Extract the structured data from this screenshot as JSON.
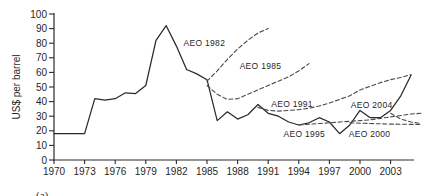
{
  "figure": {
    "caption": "(a)"
  },
  "chart_data": {
    "type": "line",
    "title": "",
    "xlabel": "",
    "ylabel": "US$ per barrel",
    "ylim": [
      0,
      100
    ],
    "xlim": [
      1970,
      2006.5
    ],
    "grid": false,
    "legend_position": "none",
    "y_ticks": [
      0,
      10,
      20,
      30,
      40,
      50,
      60,
      70,
      80,
      90,
      100
    ],
    "x_ticks": [
      1970,
      1973,
      1976,
      1979,
      1982,
      1985,
      1988,
      1991,
      1994,
      1997,
      2000,
      2003
    ],
    "line_colors": {
      "actual": "#2a2a2a",
      "forecast": "#4a4a4a"
    },
    "series": [
      {
        "name": "Actual oil price",
        "style": "solid",
        "x": [
          1970,
          1971,
          1972,
          1973,
          1974,
          1975,
          1976,
          1977,
          1978,
          1979,
          1980,
          1981,
          1982,
          1983,
          1984,
          1985,
          1986,
          1987,
          1988,
          1989,
          1990,
          1991,
          1992,
          1993,
          1994,
          1995,
          1996,
          1997,
          1998,
          1999,
          2000,
          2001,
          2002,
          2003,
          2004,
          2005
        ],
        "y": [
          18,
          18,
          18,
          18,
          42,
          41,
          42,
          46,
          45.5,
          51,
          82,
          92,
          78,
          62,
          59,
          55,
          27,
          33,
          28,
          31,
          38,
          32,
          30,
          26,
          24,
          25.5,
          29,
          26,
          18,
          24,
          34,
          29,
          29,
          34,
          44,
          58
        ]
      },
      {
        "name": "AEO 1982",
        "style": "dashed",
        "x": [
          1985,
          1986,
          1987,
          1988,
          1989,
          1990,
          1991
        ],
        "y": [
          54,
          61,
          69,
          76,
          82,
          87,
          90
        ]
      },
      {
        "name": "AEO 1985",
        "style": "dashed",
        "x": [
          1985,
          1986,
          1987,
          1988,
          1989,
          1990,
          1991,
          1992,
          1993,
          1994,
          1995
        ],
        "y": [
          51,
          45,
          41.5,
          42,
          45,
          48,
          51,
          54,
          57,
          61,
          66
        ]
      },
      {
        "name": "AEO 1991",
        "style": "dashed",
        "x": [
          1990,
          1991,
          1992,
          1993,
          1994,
          1995,
          1996,
          1997,
          1998,
          1999,
          2000,
          2001,
          2002,
          2003,
          2004,
          2005
        ],
        "y": [
          36,
          34,
          33.5,
          34,
          34.5,
          35.5,
          37,
          39,
          41.5,
          44,
          48,
          50.5,
          53,
          55,
          56.5,
          58.5
        ]
      },
      {
        "name": "AEO 1995",
        "style": "dashed",
        "x": [
          1994,
          1995,
          1996,
          1997,
          1998,
          1999,
          2000,
          2001,
          2002,
          2003,
          2004,
          2005,
          2006
        ],
        "y": [
          24,
          24.5,
          25,
          25.5,
          26,
          26.5,
          27,
          27.5,
          28.5,
          29.5,
          30.5,
          31.5,
          32
        ]
      },
      {
        "name": "AEO 2000",
        "style": "dashed",
        "x": [
          1999,
          2000,
          2001,
          2002,
          2003,
          2004,
          2005,
          2006
        ],
        "y": [
          25.5,
          25.2,
          25,
          24.8,
          24.6,
          24.5,
          24.4,
          24.3
        ]
      },
      {
        "name": "AEO 2004",
        "style": "dashed",
        "x": [
          2003,
          2004,
          2005,
          2006
        ],
        "y": [
          32,
          28,
          26,
          25
        ]
      }
    ],
    "annotations": [
      {
        "text": "AEO 1982",
        "year": 1982.7,
        "value": 78
      },
      {
        "text": "AEO 1985",
        "year": 1988.2,
        "value": 62.5
      },
      {
        "text": "AEO 1991",
        "year": 1991.3,
        "value": 36.5
      },
      {
        "text": "AEO 1995",
        "year": 1992.5,
        "value": 16
      },
      {
        "text": "AEO 2000",
        "year": 1998.9,
        "value": 16
      },
      {
        "text": "AEO 2004",
        "year": 1999.1,
        "value": 35.5
      }
    ]
  }
}
